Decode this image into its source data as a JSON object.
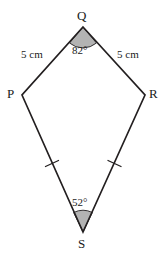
{
  "figure": {
    "name": "kite-pqrs",
    "background_color": "#ffffff",
    "stroke_color": "#231f20",
    "shade_color": "#b3b3b3",
    "vertices": [
      {
        "id": "Q",
        "label": "Q",
        "x": 83,
        "y": 27
      },
      {
        "id": "P",
        "label": "P",
        "x": 22,
        "y": 95
      },
      {
        "id": "R",
        "label": "R",
        "x": 145,
        "y": 95
      },
      {
        "id": "S",
        "label": "S",
        "x": 83,
        "y": 232
      }
    ],
    "sides": [
      {
        "id": "PQ",
        "from": "P",
        "to": "Q",
        "length_label": "5 cm",
        "ticks": 0
      },
      {
        "id": "QR",
        "from": "Q",
        "to": "R",
        "length_label": "5 cm",
        "ticks": 0
      },
      {
        "id": "PS",
        "from": "P",
        "to": "S",
        "length_label": "",
        "ticks": 1
      },
      {
        "id": "RS",
        "from": "R",
        "to": "S",
        "length_label": "",
        "ticks": 1
      }
    ],
    "angles": [
      {
        "id": "angle-Q",
        "at": "Q",
        "label": "82°",
        "shaded": true
      },
      {
        "id": "angle-S",
        "at": "S",
        "label": "52°",
        "shaded": true
      }
    ],
    "side_labels": {
      "pq": "5 cm",
      "qr": "5 cm"
    },
    "angle_labels": {
      "q": "82°",
      "s": "52°"
    },
    "vertex_labels": {
      "q": "Q",
      "p": "P",
      "r": "R",
      "s": "S"
    }
  }
}
